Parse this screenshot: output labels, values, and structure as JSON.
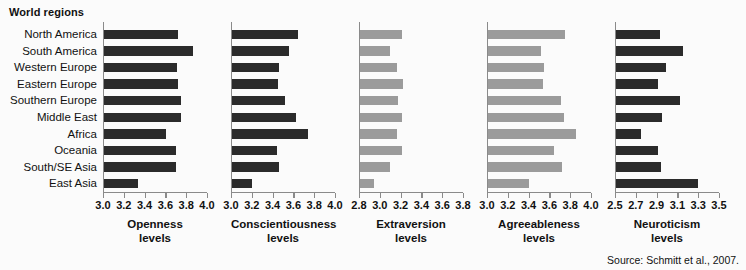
{
  "title": "World regions",
  "source": "Source: Schmitt et al., 2007.",
  "regions": [
    "North America",
    "South America",
    "Western Europe",
    "Eastern Europe",
    "Southern Europe",
    "Middle East",
    "Africa",
    "Oceania",
    "South/SE Asia",
    "East Asia"
  ],
  "colors": {
    "dark_bar": "#2b2b2b",
    "light_bar": "#9b9b9b",
    "axis": "#8a8a8a",
    "background": "#fbfbfb",
    "text": "#111111"
  },
  "chart_data": {
    "type": "bar",
    "orientation": "horizontal",
    "title": "World regions",
    "xlabel": "",
    "ylabel": "World regions",
    "grid": false,
    "legend": "none",
    "note": "Source: Schmitt et al., 2007.",
    "categories": [
      "North America",
      "South America",
      "Western Europe",
      "Eastern Europe",
      "Southern Europe",
      "Middle East",
      "Africa",
      "Oceania",
      "South/SE Asia",
      "East Asia"
    ],
    "panels": [
      {
        "name": "openness",
        "caption_line1": "Openness",
        "caption_line2": "levels",
        "bar_style": "dark",
        "xlim": [
          3.0,
          4.0
        ],
        "ticks": [
          3.0,
          3.2,
          3.4,
          3.6,
          3.8,
          4.0
        ],
        "tick_labels": [
          "3.0",
          "3.2",
          "3.4",
          "3.6",
          "3.8",
          "4.0"
        ],
        "values": [
          3.71,
          3.86,
          3.7,
          3.71,
          3.74,
          3.74,
          3.6,
          3.69,
          3.69,
          3.33
        ]
      },
      {
        "name": "conscientiousness",
        "caption_line1": "Conscientiousness",
        "caption_line2": "levels",
        "bar_style": "dark",
        "xlim": [
          3.0,
          4.0
        ],
        "ticks": [
          3.0,
          3.2,
          3.4,
          3.6,
          3.8,
          4.0
        ],
        "tick_labels": [
          "3.0",
          "3.2",
          "3.4",
          "3.6",
          "3.8",
          "4.0"
        ],
        "values": [
          3.63,
          3.55,
          3.45,
          3.44,
          3.51,
          3.62,
          3.73,
          3.43,
          3.45,
          3.19
        ]
      },
      {
        "name": "extraversion",
        "caption_line1": "Extraversion",
        "caption_line2": "levels",
        "bar_style": "light",
        "xlim": [
          2.8,
          3.8
        ],
        "ticks": [
          2.8,
          3.0,
          3.2,
          3.4,
          3.6,
          3.8
        ],
        "tick_labels": [
          "2.8",
          "3.0",
          "3.2",
          "3.4",
          "3.6",
          "3.8"
        ],
        "values": [
          3.2,
          3.09,
          3.16,
          3.21,
          3.17,
          3.2,
          3.16,
          3.2,
          3.09,
          2.93
        ]
      },
      {
        "name": "agreeableness",
        "caption_line1": "Agreeableness",
        "caption_line2": "levels",
        "bar_style": "light",
        "xlim": [
          3.0,
          4.0
        ],
        "ticks": [
          3.0,
          3.2,
          3.4,
          3.6,
          3.8,
          4.0
        ],
        "tick_labels": [
          "3.0",
          "3.2",
          "3.4",
          "3.6",
          "3.8",
          "4.0"
        ],
        "values": [
          3.74,
          3.51,
          3.54,
          3.53,
          3.7,
          3.73,
          3.85,
          3.63,
          3.71,
          3.39
        ]
      },
      {
        "name": "neuroticism",
        "caption_line1": "Neuroticism",
        "caption_line2": "levels",
        "bar_style": "dark",
        "xlim": [
          2.5,
          3.5
        ],
        "ticks": [
          2.5,
          2.7,
          2.9,
          3.1,
          3.3,
          3.5
        ],
        "tick_labels": [
          "2.5",
          "2.7",
          "2.9",
          "3.1",
          "3.3",
          "3.5"
        ],
        "values": [
          2.92,
          3.14,
          2.98,
          2.9,
          3.12,
          2.94,
          2.74,
          2.9,
          2.93,
          3.29
        ]
      }
    ]
  }
}
